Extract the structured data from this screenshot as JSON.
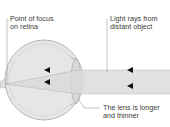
{
  "diagram": {
    "title_fragment": "",
    "labels": {
      "point_of_focus_line1": "Point of focus",
      "point_of_focus_line2": "on retina",
      "light_rays_line1": "Light rays from",
      "light_rays_line2": "distant object",
      "lens_line1": "The lens is longer",
      "lens_line2": "and thinner"
    },
    "colors": {
      "eyeball_fill": "#e6e6e6",
      "eyeball_stroke": "#a8a8a8",
      "beam_fill": "#dcdcdc",
      "arrow": "#111111",
      "leader_line": "#9a9a9a",
      "text": "#3a3a3a"
    },
    "icons": [
      "arrow-left-icon",
      "arrow-left-icon",
      "arrow-left-icon",
      "arrow-left-icon"
    ]
  }
}
